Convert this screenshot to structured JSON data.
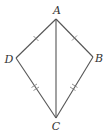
{
  "diagram": {
    "type": "kite",
    "vertices": [
      {
        "id": "A",
        "label": "A",
        "x": 56,
        "y": 19,
        "lx": 57,
        "ly": 14
      },
      {
        "id": "B",
        "label": "B",
        "x": 93,
        "y": 57,
        "lx": 99,
        "ly": 62
      },
      {
        "id": "C",
        "label": "C",
        "x": 56,
        "y": 118,
        "lx": 56,
        "ly": 130
      },
      {
        "id": "D",
        "label": "D",
        "x": 16,
        "y": 58,
        "lx": 9,
        "ly": 63
      }
    ],
    "edges": [
      {
        "from": "A",
        "to": "B",
        "ticks": 1
      },
      {
        "from": "B",
        "to": "C",
        "ticks": 2
      },
      {
        "from": "C",
        "to": "D",
        "ticks": 2
      },
      {
        "from": "D",
        "to": "A",
        "ticks": 1
      },
      {
        "from": "A",
        "to": "C",
        "ticks": 0
      }
    ],
    "colors": {
      "stroke": "#555555",
      "label": "#333333"
    }
  }
}
